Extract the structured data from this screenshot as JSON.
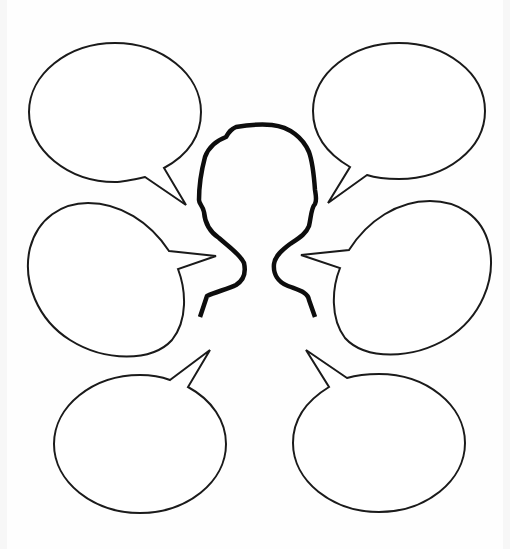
{
  "diagram": {
    "type": "speech-bubble-organizer",
    "central_figure": {
      "shape": "head-and-shoulders-silhouette",
      "icon": "person-outline-icon",
      "stroke_color": "#0d0d0d"
    },
    "bubbles": [
      {
        "id": "top-left",
        "text": ""
      },
      {
        "id": "top-right",
        "text": ""
      },
      {
        "id": "middle-left",
        "text": ""
      },
      {
        "id": "middle-right",
        "text": ""
      },
      {
        "id": "bottom-left",
        "text": ""
      },
      {
        "id": "bottom-right",
        "text": ""
      }
    ],
    "colors": {
      "background": "#fefefe",
      "bubble_fill": "#ffffff",
      "bubble_stroke": "#1a1a1a"
    }
  }
}
